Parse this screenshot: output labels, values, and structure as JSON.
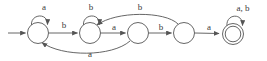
{
  "diagram": {
    "alphabet": [
      "a",
      "b"
    ],
    "stroke_color": "#555555",
    "label_color": "#3a3a3a",
    "background_color": "#ffffff",
    "states": [
      {
        "id": "q1",
        "cx": 38,
        "cy": 33,
        "r": 10.5,
        "accepting": false,
        "start": true,
        "label": ""
      },
      {
        "id": "q2",
        "cx": 90,
        "cy": 33,
        "r": 10.5,
        "accepting": false,
        "start": false,
        "label": ""
      },
      {
        "id": "q3",
        "cx": 138,
        "cy": 33,
        "r": 10.5,
        "accepting": false,
        "start": false,
        "label": ""
      },
      {
        "id": "q4",
        "cx": 184,
        "cy": 33,
        "r": 10.5,
        "accepting": false,
        "start": false,
        "label": ""
      },
      {
        "id": "q5",
        "cx": 233,
        "cy": 34,
        "r": 10.5,
        "accepting": true,
        "start": false,
        "label": ""
      }
    ],
    "transitions": [
      {
        "from": "q1",
        "to": "q1",
        "symbol": "a",
        "kind": "self-loop",
        "label_x": 44,
        "label_y": 8
      },
      {
        "from": "q1",
        "to": "q2",
        "symbol": "b",
        "kind": "straight",
        "label_x": 64,
        "label_y": 26
      },
      {
        "from": "q2",
        "to": "q2",
        "symbol": "b",
        "kind": "self-loop",
        "label_x": 91,
        "label_y": 8
      },
      {
        "from": "q2",
        "to": "q3",
        "symbol": "a",
        "kind": "straight",
        "label_x": 114,
        "label_y": 28
      },
      {
        "from": "q3",
        "to": "q1",
        "symbol": "a",
        "kind": "curve-below",
        "label_x": 90,
        "label_y": 55
      },
      {
        "from": "q3",
        "to": "q4",
        "symbol": "b",
        "kind": "straight",
        "label_x": 161,
        "label_y": 28
      },
      {
        "from": "q4",
        "to": "q2",
        "symbol": "b",
        "kind": "curve-above",
        "label_x": 140,
        "label_y": 8
      },
      {
        "from": "q4",
        "to": "q5",
        "symbol": "a",
        "kind": "straight",
        "label_x": 209,
        "label_y": 28
      },
      {
        "from": "q5",
        "to": "q5",
        "symbol": "a, b",
        "kind": "self-loop",
        "label_x": 243,
        "label_y": 9
      }
    ],
    "start_arrow": {
      "x1": 8,
      "y1": 33,
      "x2": 26,
      "y2": 33
    }
  }
}
